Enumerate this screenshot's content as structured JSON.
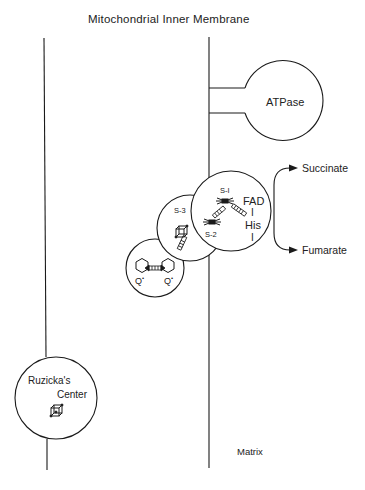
{
  "diagram": {
    "title": "Mitochondrial Inner Membrane",
    "atpase_label": "ATPase",
    "products": {
      "succinate": "Succinate",
      "fumarate": "Fumarate"
    },
    "complex": {
      "s1": "S-I",
      "s2": "S-2",
      "s3": "S-3",
      "fad": "FAD",
      "bond": "I",
      "his": "His",
      "bond2": "I"
    },
    "quinone": {
      "q_left": "Q",
      "q_left_sup": "•",
      "q_right": "Q",
      "q_right_sup": "•"
    },
    "ruzicka": {
      "line1": "Ruzicka's",
      "line2": "Center"
    },
    "matrix_label": "Matrix",
    "colors": {
      "line": "#1a1a1a",
      "background": "#ffffff"
    }
  }
}
